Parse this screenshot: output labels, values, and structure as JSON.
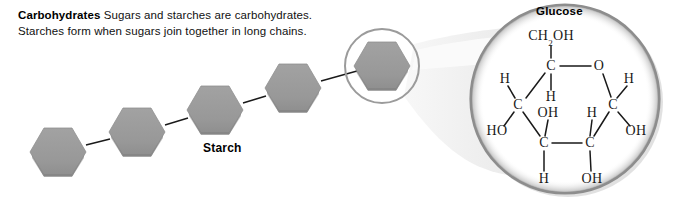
{
  "caption": {
    "lead": "Carbohydrates",
    "body": "Sugars and starches are carbohydrates. Starches form when sugars join together in long chains."
  },
  "starch": {
    "label": "Starch",
    "unit_count": 5,
    "hexagon_fill": "#9a9a9a",
    "hexagon_edge": "#8a8a8a",
    "bond_color": "#1a1a1a",
    "units": [
      {
        "name": "sugar-unit-1",
        "cx": 58,
        "cy": 152
      },
      {
        "name": "sugar-unit-2",
        "cx": 137,
        "cy": 132
      },
      {
        "name": "sugar-unit-3",
        "cx": 215,
        "cy": 110
      },
      {
        "name": "sugar-unit-4",
        "cx": 293,
        "cy": 88
      },
      {
        "name": "sugar-unit-5",
        "cx": 382,
        "cy": 66
      }
    ],
    "highlight_circle": {
      "cx": 382,
      "cy": 66,
      "r": 37,
      "stroke": "#9b9b9b"
    }
  },
  "magnifier": {
    "circle": {
      "cx": 565,
      "cy": 99,
      "r": 95,
      "stroke": "#8d8d8d",
      "fill": "#ffffff"
    },
    "cone_fill": "#ededed"
  },
  "glucose": {
    "title": "Glucose",
    "atoms": [
      {
        "name": "atom-ch2oh",
        "text": "CH",
        "sub": "2",
        "text2": "OH",
        "x": 551,
        "y": 37
      },
      {
        "name": "atom-c-top",
        "text": "C",
        "x": 551,
        "y": 66
      },
      {
        "name": "atom-o-ring",
        "text": "O",
        "x": 599,
        "y": 66
      },
      {
        "name": "atom-h-upper-left",
        "text": "H",
        "x": 505,
        "y": 79
      },
      {
        "name": "atom-h-upper-right",
        "text": "H",
        "x": 629,
        "y": 79
      },
      {
        "name": "atom-h-center-top",
        "text": "H",
        "x": 551,
        "y": 97
      },
      {
        "name": "atom-c-left",
        "text": "C",
        "x": 518,
        "y": 105
      },
      {
        "name": "atom-c-right",
        "text": "C",
        "x": 613,
        "y": 105
      },
      {
        "name": "atom-oh-center",
        "text": "OH",
        "x": 548,
        "y": 113
      },
      {
        "name": "atom-h-mid-right",
        "text": "H",
        "x": 592,
        "y": 113
      },
      {
        "name": "atom-ho-left",
        "text": "HO",
        "x": 497,
        "y": 131
      },
      {
        "name": "atom-oh-right",
        "text": "OH",
        "x": 636,
        "y": 131
      },
      {
        "name": "atom-c-bottom-left",
        "text": "C",
        "x": 544,
        "y": 143
      },
      {
        "name": "atom-c-bottom-right",
        "text": "C",
        "x": 590,
        "y": 143
      },
      {
        "name": "atom-h-bottom",
        "text": "H",
        "x": 544,
        "y": 179
      },
      {
        "name": "atom-oh-bottom",
        "text": "OH",
        "x": 592,
        "y": 179
      }
    ],
    "bonds": [
      {
        "name": "bond-ch2oh-c",
        "x1": 551,
        "y1": 46,
        "x2": 551,
        "y2": 58
      },
      {
        "name": "bond-c-o-ring",
        "x1": 560,
        "y1": 66,
        "x2": 591,
        "y2": 66
      },
      {
        "name": "bond-c-cleft",
        "x1": 545,
        "y1": 73,
        "x2": 526,
        "y2": 98
      },
      {
        "name": "bond-c-h-center",
        "x1": 551,
        "y1": 74,
        "x2": 551,
        "y2": 90
      },
      {
        "name": "bond-o-cright",
        "x1": 603,
        "y1": 74,
        "x2": 611,
        "y2": 97
      },
      {
        "name": "bond-h-cleft",
        "x1": 508,
        "y1": 86,
        "x2": 515,
        "y2": 98
      },
      {
        "name": "bond-h-cright",
        "x1": 627,
        "y1": 86,
        "x2": 617,
        "y2": 98
      },
      {
        "name": "bond-cleft-ho",
        "x1": 514,
        "y1": 112,
        "x2": 504,
        "y2": 126
      },
      {
        "name": "bond-cleft-cbl",
        "x1": 523,
        "y1": 112,
        "x2": 540,
        "y2": 136
      },
      {
        "name": "bond-cright-oh",
        "x1": 618,
        "y1": 112,
        "x2": 630,
        "y2": 126
      },
      {
        "name": "bond-cright-cbr",
        "x1": 609,
        "y1": 112,
        "x2": 594,
        "y2": 136
      },
      {
        "name": "bond-oh-center-cbl",
        "x1": 548,
        "y1": 120,
        "x2": 545,
        "y2": 136
      },
      {
        "name": "bond-h-midright-cbr",
        "x1": 592,
        "y1": 120,
        "x2": 590,
        "y2": 136
      },
      {
        "name": "bond-cbl-cbr",
        "x1": 552,
        "y1": 143,
        "x2": 582,
        "y2": 143
      },
      {
        "name": "bond-cbl-h",
        "x1": 544,
        "y1": 151,
        "x2": 544,
        "y2": 171
      },
      {
        "name": "bond-cbr-oh",
        "x1": 590,
        "y1": 151,
        "x2": 591,
        "y2": 171
      }
    ]
  }
}
